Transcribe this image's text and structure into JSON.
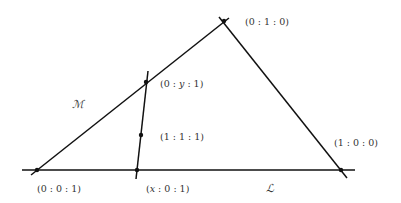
{
  "diagram": {
    "colors": {
      "line": "#111111",
      "text": "#333333",
      "background": "#ffffff"
    },
    "lines": [
      {
        "name": "L",
        "label": "ℒ"
      },
      {
        "name": "M",
        "label": "ℳ"
      }
    ],
    "points": [
      {
        "id": "p001",
        "label": "(0 : 0 : 1)"
      },
      {
        "id": "p010",
        "label": "(0 : 1 : 0)"
      },
      {
        "id": "p100",
        "label": "(1 : 0 : 0)"
      },
      {
        "id": "p111",
        "label": "(1 : 1 : 1)"
      },
      {
        "id": "p0y1",
        "label_pre": "(0 : ",
        "label_var": "y",
        "label_post": " : 1)"
      },
      {
        "id": "px01",
        "label_pre": "(",
        "label_var": "x",
        "label_post": " : 0 : 1)"
      }
    ]
  }
}
